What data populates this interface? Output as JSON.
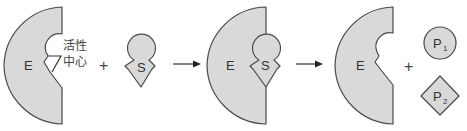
{
  "diagram": {
    "title": "",
    "colors": {
      "shape_fill": "#d9d9d9",
      "outline": "#4a4a4a",
      "text": "#333333"
    },
    "enzyme_free": {
      "label": "E"
    },
    "active_site": {
      "label_line1": "活性",
      "label_line2": "中心"
    },
    "plus_1": "+",
    "substrate": {
      "label": "S"
    },
    "arrow_1": "→",
    "complex": {
      "enzyme_label": "E",
      "substrate_label": "S"
    },
    "arrow_2": "→",
    "enzyme_released": {
      "label": "E"
    },
    "plus_2": "+",
    "product_1": {
      "label": "P",
      "subscript": "1"
    },
    "product_2": {
      "label": "P",
      "subscript": "2"
    }
  }
}
